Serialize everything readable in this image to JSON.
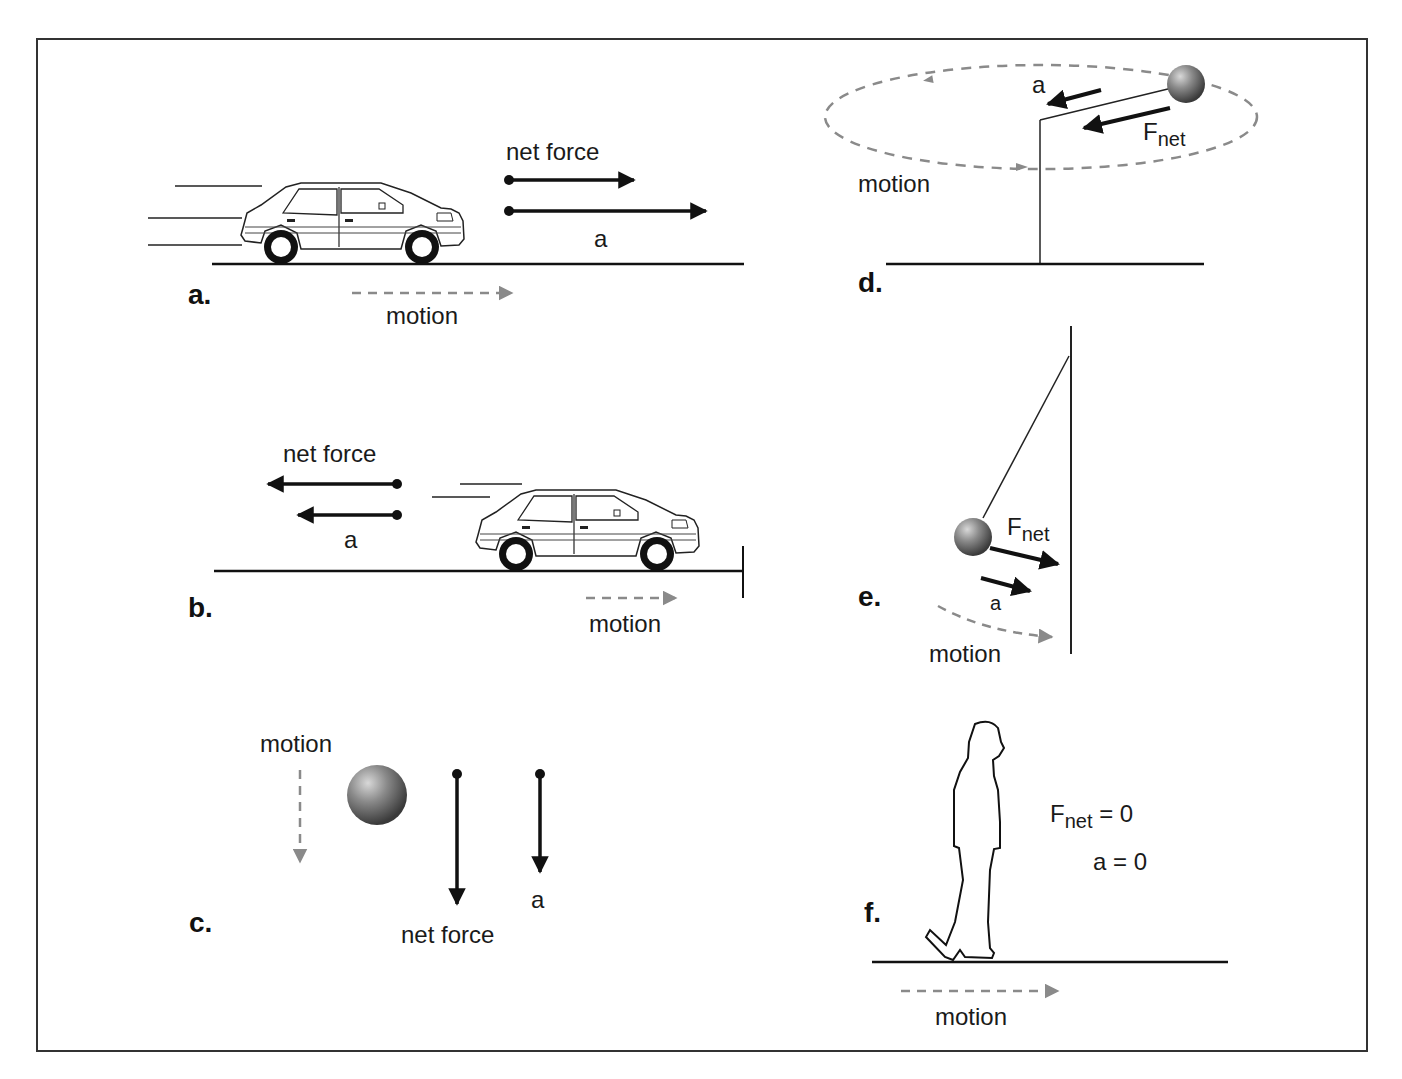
{
  "figure": {
    "panels": {
      "a": {
        "label": "a.",
        "net_force_label": "net force",
        "accel_label": "a",
        "motion_label": "motion"
      },
      "b": {
        "label": "b.",
        "net_force_label": "net force",
        "accel_label": "a",
        "motion_label": "motion"
      },
      "c": {
        "label": "c.",
        "net_force_label": "net force",
        "accel_label": "a",
        "motion_label": "motion"
      },
      "d": {
        "label": "d.",
        "accel_label": "a",
        "fnet_main": "F",
        "fnet_sub": "net",
        "motion_label": "motion"
      },
      "e": {
        "label": "e.",
        "accel_label": "a",
        "fnet_main": "F",
        "fnet_sub": "net",
        "motion_label": "motion"
      },
      "f": {
        "label": "f.",
        "fnet_main": "F",
        "fnet_sub": "net",
        "fnet_eq": " = 0",
        "accel_eq": "a = 0",
        "motion_label": "motion"
      }
    },
    "colors": {
      "line": "#111111",
      "motion_dash": "#8a8a8a",
      "border": "#333333"
    }
  }
}
